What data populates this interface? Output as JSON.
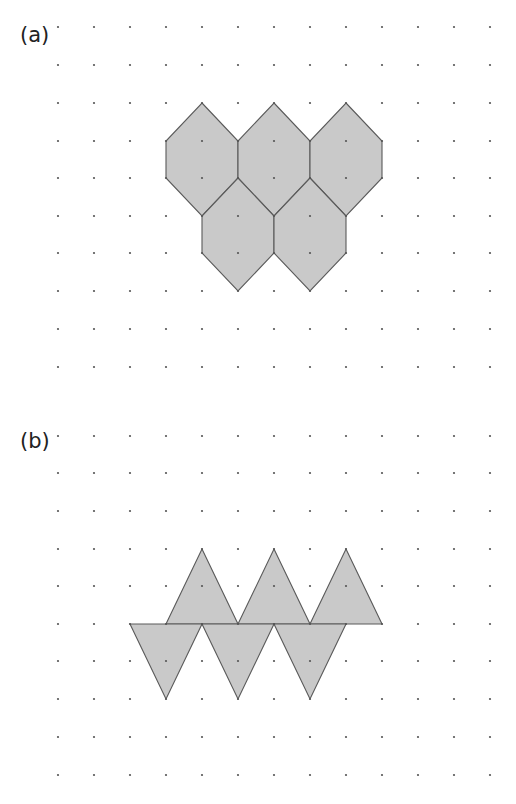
{
  "parts": [
    {
      "id": "a",
      "label": "(a)",
      "label_pos": [
        20,
        27
      ],
      "grid": {
        "x_start": 58,
        "x_step": 36,
        "cols": 13,
        "rows_y": [
          27,
          65,
          103,
          141,
          178,
          216,
          253,
          291,
          329,
          367
        ]
      },
      "shape_type": "hexagon",
      "shapes": [
        [
          [
            202,
            103
          ],
          [
            238,
            141
          ],
          [
            238,
            178
          ],
          [
            202,
            216
          ],
          [
            166,
            178
          ],
          [
            166,
            141
          ]
        ],
        [
          [
            274,
            103
          ],
          [
            310,
            141
          ],
          [
            310,
            178
          ],
          [
            274,
            216
          ],
          [
            238,
            178
          ],
          [
            238,
            141
          ]
        ],
        [
          [
            346,
            103
          ],
          [
            382,
            141
          ],
          [
            382,
            178
          ],
          [
            346,
            216
          ],
          [
            310,
            178
          ],
          [
            310,
            141
          ]
        ],
        [
          [
            238,
            178
          ],
          [
            274,
            216
          ],
          [
            274,
            253
          ],
          [
            238,
            291
          ],
          [
            202,
            253
          ],
          [
            202,
            216
          ]
        ],
        [
          [
            310,
            178
          ],
          [
            346,
            216
          ],
          [
            346,
            253
          ],
          [
            310,
            291
          ],
          [
            274,
            253
          ],
          [
            274,
            216
          ]
        ]
      ]
    },
    {
      "id": "b",
      "label": "(b)",
      "label_pos": [
        20,
        433
      ],
      "grid": {
        "x_start": 58,
        "x_step": 36,
        "cols": 13,
        "rows_y": [
          436,
          473,
          511,
          549,
          586,
          624,
          661,
          699,
          737,
          775
        ]
      },
      "shape_type": "triangle",
      "shapes": [
        [
          [
            202,
            549
          ],
          [
            238,
            624
          ],
          [
            166,
            624
          ]
        ],
        [
          [
            274,
            549
          ],
          [
            310,
            624
          ],
          [
            238,
            624
          ]
        ],
        [
          [
            346,
            549
          ],
          [
            382,
            624
          ],
          [
            310,
            624
          ]
        ],
        [
          [
            130,
            624
          ],
          [
            202,
            624
          ],
          [
            166,
            699
          ]
        ],
        [
          [
            202,
            624
          ],
          [
            274,
            624
          ],
          [
            238,
            699
          ]
        ],
        [
          [
            274,
            624
          ],
          [
            346,
            624
          ],
          [
            310,
            699
          ]
        ]
      ]
    }
  ],
  "colors": {
    "shape_fill": "#c9c9c9",
    "shape_stroke": "#5a5a5a",
    "dot": "#555555",
    "label": "#222222"
  }
}
